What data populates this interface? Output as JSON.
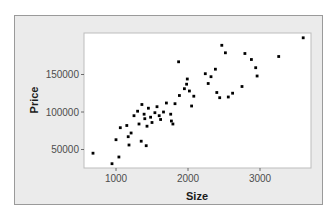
{
  "chart_data": {
    "type": "scatter",
    "title": "",
    "xlabel": "Size",
    "ylabel": "Price",
    "xlim": [
      550,
      3700
    ],
    "ylim": [
      22000,
      202000
    ],
    "xticks": [
      1000,
      2000,
      3000
    ],
    "xtick_labels": [
      "1000",
      "2000",
      "3000"
    ],
    "yticks": [
      50000,
      100000,
      150000
    ],
    "ytick_labels": [
      "50000",
      "100000",
      "150000"
    ],
    "grid": false,
    "legend": null,
    "point_color": "#000000",
    "panel_background": "#ffffff",
    "frame_background": "#ebebeb",
    "points": [
      {
        "x": 680,
        "y": 45000
      },
      {
        "x": 945,
        "y": 31000
      },
      {
        "x": 1040,
        "y": 40000
      },
      {
        "x": 1000,
        "y": 63000
      },
      {
        "x": 1060,
        "y": 79000
      },
      {
        "x": 1180,
        "y": 56000
      },
      {
        "x": 1150,
        "y": 82000
      },
      {
        "x": 1210,
        "y": 72000
      },
      {
        "x": 1170,
        "y": 67000
      },
      {
        "x": 1320,
        "y": 84000
      },
      {
        "x": 1300,
        "y": 101000
      },
      {
        "x": 1360,
        "y": 110000
      },
      {
        "x": 1250,
        "y": 95000
      },
      {
        "x": 1390,
        "y": 97000
      },
      {
        "x": 1350,
        "y": 61000
      },
      {
        "x": 1420,
        "y": 55000
      },
      {
        "x": 1430,
        "y": 81000
      },
      {
        "x": 1400,
        "y": 91000
      },
      {
        "x": 1450,
        "y": 105000
      },
      {
        "x": 1480,
        "y": 93000
      },
      {
        "x": 1500,
        "y": 86000
      },
      {
        "x": 1540,
        "y": 99000
      },
      {
        "x": 1570,
        "y": 107000
      },
      {
        "x": 1600,
        "y": 95000
      },
      {
        "x": 1620,
        "y": 90000
      },
      {
        "x": 1660,
        "y": 100000
      },
      {
        "x": 1700,
        "y": 112000
      },
      {
        "x": 1760,
        "y": 97000
      },
      {
        "x": 1770,
        "y": 88000
      },
      {
        "x": 1790,
        "y": 84000
      },
      {
        "x": 1820,
        "y": 111000
      },
      {
        "x": 1880,
        "y": 122000
      },
      {
        "x": 1870,
        "y": 167000
      },
      {
        "x": 1950,
        "y": 131000
      },
      {
        "x": 1980,
        "y": 137000
      },
      {
        "x": 1990,
        "y": 144000
      },
      {
        "x": 2020,
        "y": 128000
      },
      {
        "x": 2050,
        "y": 108000
      },
      {
        "x": 2080,
        "y": 121000
      },
      {
        "x": 2240,
        "y": 151000
      },
      {
        "x": 2280,
        "y": 138000
      },
      {
        "x": 2320,
        "y": 147000
      },
      {
        "x": 2380,
        "y": 157000
      },
      {
        "x": 2400,
        "y": 126000
      },
      {
        "x": 2440,
        "y": 119000
      },
      {
        "x": 2470,
        "y": 189000
      },
      {
        "x": 2520,
        "y": 179000
      },
      {
        "x": 2560,
        "y": 120000
      },
      {
        "x": 2620,
        "y": 125000
      },
      {
        "x": 2750,
        "y": 134000
      },
      {
        "x": 2790,
        "y": 178000
      },
      {
        "x": 2880,
        "y": 170000
      },
      {
        "x": 2940,
        "y": 159000
      },
      {
        "x": 2960,
        "y": 148000
      },
      {
        "x": 3260,
        "y": 174000
      },
      {
        "x": 3600,
        "y": 199000
      }
    ]
  }
}
